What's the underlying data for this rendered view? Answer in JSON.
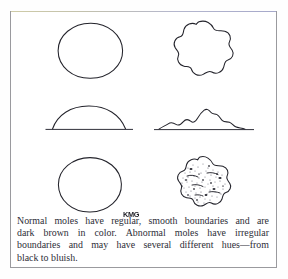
{
  "figure": {
    "kind": "medical-illustration",
    "signature": "KMG",
    "border_color": "#9a9a9e",
    "ink_color": "#23232b",
    "page_background": "#ffffff",
    "panels": [
      {
        "id": "top-left",
        "name": "normal-mole-top-view",
        "label": "normal mole, top view",
        "description": "Smooth regular circular outline"
      },
      {
        "id": "top-right",
        "name": "abnormal-mole-top-view",
        "label": "abnormal mole, top view",
        "description": "Irregular wavy lobed outline"
      },
      {
        "id": "middle-left",
        "name": "normal-mole-profile-view",
        "label": "normal mole, profile view",
        "description": "Smooth even dome on skin baseline"
      },
      {
        "id": "middle-right",
        "name": "abnormal-mole-profile-view",
        "label": "abnormal mole, profile view",
        "description": "Bumpy uneven raised profile on skin baseline"
      },
      {
        "id": "bottom-left",
        "name": "normal-mole-color-view",
        "label": "normal mole, color view",
        "description": "Uniform circular outline, even dark brown color"
      },
      {
        "id": "bottom-right",
        "name": "abnormal-mole-color-view",
        "label": "abnormal mole, color view",
        "description": "Irregular outline with mottled speckled pigmentation"
      }
    ]
  },
  "caption": {
    "lines": [
      "Normal moles have regular, smooth boundaries and are",
      "dark brown in color. Abnormal moles have irregular",
      "boundaries and may have several different hues—from",
      "black to bluish."
    ],
    "line1_words": [
      "Normal",
      "moles",
      "have",
      "regular,",
      "smooth",
      "boundaries",
      "and",
      "are"
    ],
    "line2_words": [
      "dark",
      "brown",
      "in",
      "color.",
      "Abnormal",
      "moles",
      "have",
      "irregular"
    ],
    "line3_words": [
      "boundaries",
      "and",
      "may",
      "have",
      "several",
      "different",
      "hues—from"
    ],
    "line4": "black to bluish.",
    "full_text": "Normal moles have regular, smooth boundaries and are dark brown in color. Abnormal moles have irregular boundaries and may have several different hues—from black to bluish."
  }
}
